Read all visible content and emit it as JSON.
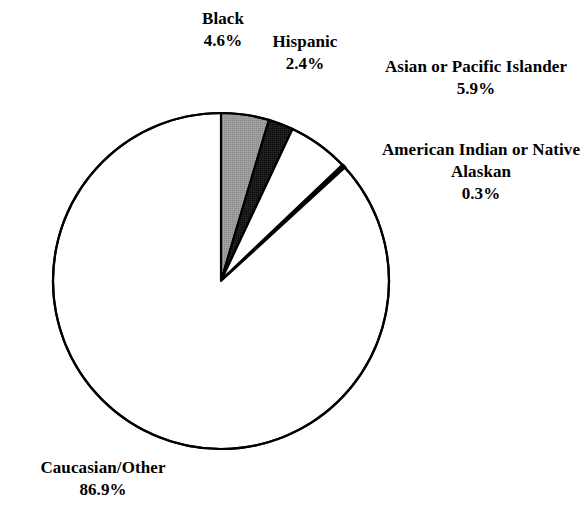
{
  "chart_data": {
    "type": "pie",
    "title": "",
    "subtitle": "",
    "xlabel": "",
    "ylabel": "",
    "legend_position": "none",
    "grid": false,
    "start_angle_deg": 0,
    "direction": "clockwise",
    "units": "percent",
    "categories": [
      "Black",
      "Hispanic",
      "Asian or Pacific Islander",
      "American Indian or Native Alaskan",
      "Caucasian/Other"
    ],
    "values": [
      4.6,
      2.4,
      5.9,
      0.3,
      86.9
    ],
    "value_labels": [
      "4.6%",
      "2.4%",
      "5.9%",
      "0.3%",
      "86.9%"
    ],
    "slice_colors": [
      "#9a9a9a",
      "#1a1a1a",
      "#ffffff",
      "#111111",
      "#ffffff"
    ],
    "slice_outline_color": "#000000",
    "slices": [
      {
        "name": "Black",
        "value": 4.6,
        "value_label": "4.6%",
        "fill": "#9a9a9a",
        "start_deg": 0.0,
        "end_deg": 16.56
      },
      {
        "name": "Hispanic",
        "value": 2.4,
        "value_label": "2.4%",
        "fill": "#1a1a1a",
        "start_deg": 16.56,
        "end_deg": 25.2
      },
      {
        "name": "Asian or Pacific Islander",
        "value": 5.9,
        "value_label": "5.9%",
        "fill": "#ffffff",
        "start_deg": 25.2,
        "end_deg": 46.44
      },
      {
        "name": "American Indian or Native Alaskan",
        "value": 0.3,
        "value_label": "0.3%",
        "fill": "#111111",
        "start_deg": 46.44,
        "end_deg": 47.52
      },
      {
        "name": "Caucasian/Other",
        "value": 86.9,
        "value_label": "86.9%",
        "fill": "#ffffff",
        "start_deg": 47.52,
        "end_deg": 360.0
      }
    ]
  },
  "labels": {
    "black": {
      "name": "Black",
      "value": "4.6%"
    },
    "hispanic": {
      "name": "Hispanic",
      "value": "2.4%"
    },
    "asian": {
      "name": "Asian or Pacific Islander",
      "value": "5.9%"
    },
    "american_indian": {
      "name": "American Indian or Native Alaskan",
      "value": "0.3%"
    },
    "caucasian": {
      "name": "Caucasian/Other",
      "value": "86.9%"
    }
  },
  "geometry": {
    "center_x": 221,
    "center_y": 281,
    "radius": 168
  },
  "colors": {
    "background": "#ffffff",
    "text": "#000000",
    "outline": "#000000",
    "gray_slice": "#9a9a9a",
    "dark_slice": "#1a1a1a",
    "white_slice": "#ffffff"
  }
}
